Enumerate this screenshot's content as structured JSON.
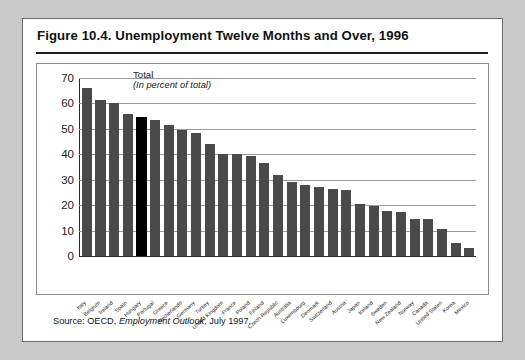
{
  "figure": {
    "title": "Figure 10.4. Unemployment Twelve Months and Over, 1996",
    "source": "Source:  OECD, ",
    "source_italic": "Employment Outlook",
    "source_tail": ", July 1997."
  },
  "legend": {
    "line1": "Total",
    "line2": "(In percent of total)"
  },
  "colors": {
    "bar": "#4a4a4a",
    "highlight_bar": "#000000",
    "grid": "#9a9a9a",
    "page_background": "#c9c9c9",
    "card_background": "#ffffff"
  },
  "chart_data": {
    "type": "bar",
    "title": "Figure 10.4. Unemployment Twelve Months and Over, 1996",
    "subtitle": "Total (In percent of total)",
    "xlabel": "",
    "ylabel": "",
    "ylim": [
      0,
      70
    ],
    "yticks": [
      0,
      10,
      20,
      30,
      40,
      50,
      60,
      70
    ],
    "ytick_labels": [
      "0",
      "10",
      "20",
      "30",
      "40",
      "50",
      "60",
      "70"
    ],
    "grid": true,
    "legend_position": "inside-top-left",
    "highlight_category": "Hungary",
    "categories": [
      "Italy",
      "Belgium",
      "Ireland",
      "Spain",
      "Hungary",
      "Portugal",
      "Greece",
      "Netherlands",
      "Germany",
      "Turkey",
      "United Kingdom",
      "France",
      "Poland",
      "Finland",
      "Czech Republic",
      "Australia",
      "Luxembourg",
      "Denmark",
      "Switzerland",
      "Austria",
      "Japan",
      "Iceland",
      "Sweden",
      "New Zealand",
      "Norway",
      "Canada",
      "United States",
      "Korea",
      "Mexico"
    ],
    "values": [
      66.0,
      61.5,
      60.0,
      56.0,
      54.5,
      53.5,
      51.5,
      49.5,
      48.5,
      44.0,
      40.0,
      40.0,
      39.5,
      36.5,
      32.0,
      29.0,
      27.8,
      27.0,
      26.5,
      26.0,
      20.5,
      19.5,
      17.8,
      17.5,
      14.5,
      14.5,
      10.5,
      5.0,
      3.0
    ]
  }
}
